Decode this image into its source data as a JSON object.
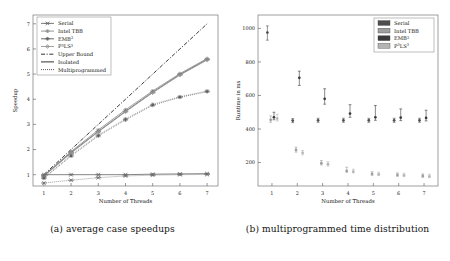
{
  "figure": {
    "panels": [
      {
        "id": "a",
        "caption": "(a) average case speedups"
      },
      {
        "id": "b",
        "caption": "(b) multiprogrammed time distribution"
      }
    ]
  },
  "chart_data": [
    {
      "type": "line",
      "panel": "a",
      "title": "",
      "xlabel": "Number of Threads",
      "ylabel": "Speedup",
      "x": [
        1,
        2,
        3,
        4,
        5,
        6,
        7
      ],
      "xlim": [
        0.6,
        7.4
      ],
      "ylim": [
        0.55,
        7.35
      ],
      "xticks": [
        1,
        2,
        3,
        4,
        5,
        6,
        7
      ],
      "yticks": [
        1,
        2,
        3,
        4,
        5,
        6,
        7
      ],
      "grid": false,
      "legend_position": "top-left",
      "legend": [
        {
          "label": "Serial",
          "marker": "cross-bar",
          "color": "#6e6e6e"
        },
        {
          "label": "Intel TBB",
          "marker": "star",
          "color": "#8c8c8c"
        },
        {
          "label": "EMB",
          "sup": "2",
          "marker": "asterisk",
          "color": "#5a5a5a"
        },
        {
          "label": "P",
          "sup": "3",
          "label2": "LS",
          "sup2": "3",
          "marker": "diamond",
          "color": "#9a9a9a"
        },
        {
          "label": "Upper Bound",
          "style": "dashdot",
          "color": "#1a1a1a"
        },
        {
          "label": "Isolated",
          "style": "solid",
          "color": "#1a1a1a"
        },
        {
          "label": "Multiprogrammed",
          "style": "dotted",
          "color": "#1a1a1a"
        }
      ],
      "series": [
        {
          "name": "Upper Bound",
          "style": "dashdot",
          "color": "#1a1a1a",
          "marker": "none",
          "values": [
            1.0,
            2.0,
            3.0,
            4.0,
            5.0,
            6.0,
            7.0
          ]
        },
        {
          "name": "Intel TBB isolated",
          "style": "solid",
          "color": "#8c8c8c",
          "marker": "star",
          "values": [
            0.97,
            1.92,
            2.78,
            3.58,
            4.33,
            5.02,
            5.62
          ]
        },
        {
          "name": "EMB2 isolated",
          "style": "solid",
          "color": "#5a5a5a",
          "marker": "asterisk",
          "values": [
            0.95,
            1.88,
            2.72,
            3.52,
            4.28,
            4.98,
            5.58
          ]
        },
        {
          "name": "P3LS3 isolated",
          "style": "solid",
          "color": "#9a9a9a",
          "marker": "diamond",
          "values": [
            0.94,
            1.86,
            2.7,
            3.5,
            4.26,
            4.96,
            5.56
          ]
        },
        {
          "name": "Intel TBB multiprogrammed",
          "style": "dotted",
          "color": "#8c8c8c",
          "marker": "star",
          "values": [
            0.88,
            1.78,
            2.58,
            3.22,
            3.8,
            4.1,
            4.33
          ]
        },
        {
          "name": "EMB2 multiprogrammed",
          "style": "dotted",
          "color": "#5a5a5a",
          "marker": "asterisk",
          "values": [
            0.86,
            1.74,
            2.54,
            3.18,
            3.76,
            4.08,
            4.3
          ]
        },
        {
          "name": "Serial isolated",
          "style": "solid",
          "color": "#6e6e6e",
          "marker": "cross-bar",
          "values": [
            1.0,
            1.0,
            1.0,
            1.0,
            1.02,
            1.03,
            1.04
          ]
        },
        {
          "name": "Serial multiprogrammed",
          "style": "dotted",
          "color": "#6e6e6e",
          "marker": "cross-bar",
          "values": [
            0.67,
            0.78,
            0.88,
            0.95,
            0.98,
            1.0,
            1.01
          ]
        }
      ]
    },
    {
      "type": "scatter",
      "panel": "b",
      "title": "",
      "xlabel": "Number of Threads",
      "ylabel": "Runtime in ms",
      "xlim": [
        0.45,
        7.55
      ],
      "ylim": [
        60,
        1080
      ],
      "xticks": [
        1,
        2,
        3,
        4,
        5,
        6,
        7
      ],
      "yticks": [
        200,
        400,
        600,
        800,
        1000
      ],
      "grid": false,
      "legend_position": "top-right",
      "legend": [
        {
          "label": "Serial",
          "swatch": "#4d4d4d"
        },
        {
          "label": "Intel TBB",
          "swatch": "#9e9e9e"
        },
        {
          "label": "EMB",
          "sup": "2",
          "swatch": "#3a3a3a"
        },
        {
          "label": "P",
          "sup": "3",
          "label2": "LS",
          "sup2": "3",
          "swatch": "#b5b5b5"
        }
      ],
      "groups": [
        {
          "thread": 1,
          "points": [
            {
              "series": "Serial",
              "x": 0.82,
              "median": 975,
              "low": 930,
              "high": 1015,
              "color": "#4d4d4d"
            },
            {
              "series": "Intel TBB",
              "x": 0.95,
              "median": 455,
              "low": 440,
              "high": 478,
              "color": "#9e9e9e"
            },
            {
              "series": "EMB2",
              "x": 1.08,
              "median": 470,
              "low": 455,
              "high": 500,
              "color": "#3a3a3a"
            },
            {
              "series": "P3LS3",
              "x": 1.21,
              "median": 462,
              "low": 448,
              "high": 488,
              "color": "#b5b5b5"
            }
          ]
        },
        {
          "thread": 2,
          "points": [
            {
              "series": "Serial",
              "x": 1.82,
              "median": 450,
              "low": 438,
              "high": 462,
              "color": "#4d4d4d"
            },
            {
              "series": "Intel TBB",
              "x": 1.95,
              "median": 275,
              "low": 262,
              "high": 292,
              "color": "#9e9e9e"
            },
            {
              "series": "EMB2",
              "x": 2.08,
              "median": 705,
              "low": 660,
              "high": 745,
              "color": "#3a3a3a"
            },
            {
              "series": "P3LS3",
              "x": 2.21,
              "median": 258,
              "low": 246,
              "high": 272,
              "color": "#b5b5b5"
            }
          ]
        },
        {
          "thread": 3,
          "points": [
            {
              "series": "Serial",
              "x": 2.82,
              "median": 452,
              "low": 440,
              "high": 464,
              "color": "#4d4d4d"
            },
            {
              "series": "Intel TBB",
              "x": 2.95,
              "median": 196,
              "low": 186,
              "high": 212,
              "color": "#9e9e9e"
            },
            {
              "series": "EMB2",
              "x": 3.08,
              "median": 580,
              "low": 548,
              "high": 640,
              "color": "#3a3a3a"
            },
            {
              "series": "P3LS3",
              "x": 3.21,
              "median": 190,
              "low": 180,
              "high": 205,
              "color": "#b5b5b5"
            }
          ]
        },
        {
          "thread": 4,
          "points": [
            {
              "series": "Serial",
              "x": 3.82,
              "median": 452,
              "low": 440,
              "high": 464,
              "color": "#4d4d4d"
            },
            {
              "series": "Intel TBB",
              "x": 3.95,
              "median": 150,
              "low": 142,
              "high": 172,
              "color": "#9e9e9e"
            },
            {
              "series": "EMB2",
              "x": 4.08,
              "median": 492,
              "low": 470,
              "high": 545,
              "color": "#3a3a3a"
            },
            {
              "series": "P3LS3",
              "x": 4.21,
              "median": 146,
              "low": 138,
              "high": 160,
              "color": "#b5b5b5"
            }
          ]
        },
        {
          "thread": 5,
          "points": [
            {
              "series": "Serial",
              "x": 4.82,
              "median": 452,
              "low": 440,
              "high": 464,
              "color": "#4d4d4d"
            },
            {
              "series": "Intel TBB",
              "x": 4.95,
              "median": 132,
              "low": 124,
              "high": 145,
              "color": "#9e9e9e"
            },
            {
              "series": "EMB2",
              "x": 5.08,
              "median": 470,
              "low": 452,
              "high": 540,
              "color": "#3a3a3a"
            },
            {
              "series": "P3LS3",
              "x": 5.21,
              "median": 130,
              "low": 122,
              "high": 142,
              "color": "#b5b5b5"
            }
          ]
        },
        {
          "thread": 6,
          "points": [
            {
              "series": "Serial",
              "x": 5.82,
              "median": 452,
              "low": 440,
              "high": 464,
              "color": "#4d4d4d"
            },
            {
              "series": "Intel TBB",
              "x": 5.95,
              "median": 126,
              "low": 118,
              "high": 138,
              "color": "#9e9e9e"
            },
            {
              "series": "EMB2",
              "x": 6.08,
              "median": 468,
              "low": 450,
              "high": 520,
              "color": "#3a3a3a"
            },
            {
              "series": "P3LS3",
              "x": 6.21,
              "median": 124,
              "low": 116,
              "high": 136,
              "color": "#b5b5b5"
            }
          ]
        },
        {
          "thread": 7,
          "points": [
            {
              "series": "Serial",
              "x": 6.82,
              "median": 452,
              "low": 440,
              "high": 464,
              "color": "#4d4d4d"
            },
            {
              "series": "Intel TBB",
              "x": 6.95,
              "median": 120,
              "low": 112,
              "high": 132,
              "color": "#9e9e9e"
            },
            {
              "series": "EMB2",
              "x": 7.08,
              "median": 466,
              "low": 448,
              "high": 512,
              "color": "#3a3a3a"
            },
            {
              "series": "P3LS3",
              "x": 7.21,
              "median": 118,
              "low": 110,
              "high": 130,
              "color": "#b5b5b5"
            }
          ]
        }
      ]
    }
  ]
}
